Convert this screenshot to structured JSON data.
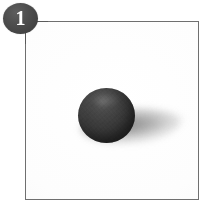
{
  "figure": {
    "callout": {
      "number": "1",
      "badge_color": "#454545",
      "number_color": "#ffffff"
    },
    "frame": {
      "border_color": "#6f6f6f",
      "background_color": "#ffffff"
    },
    "subject": {
      "label": "dark gray rubber ball",
      "color": "#3a3a3a",
      "shadow_color": "#8a8a8a"
    }
  }
}
